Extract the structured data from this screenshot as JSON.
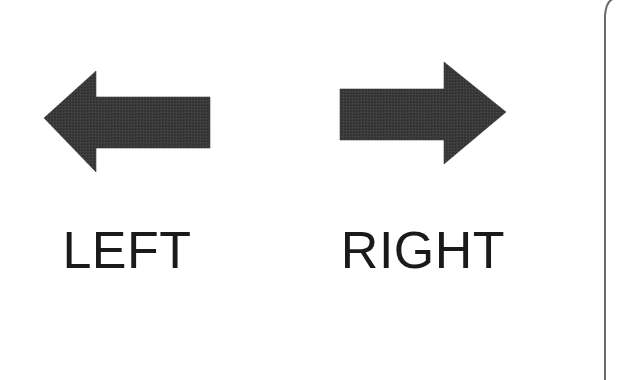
{
  "page": {
    "background_color": "#ffffff",
    "width": 632,
    "height": 380,
    "edge_line_color": "#6b6b6b"
  },
  "controls": [
    {
      "id": "left",
      "icon": "arrow-left-icon",
      "label": "LEFT",
      "direction": "left",
      "fill_color": "#3b3b3b",
      "label_color": "#1a1a1a"
    },
    {
      "id": "right",
      "icon": "arrow-right-icon",
      "label": "RIGHT",
      "direction": "right",
      "fill_color": "#3b3b3b",
      "label_color": "#1a1a1a"
    }
  ],
  "left": {
    "label": "LEFT"
  },
  "right": {
    "label": "RIGHT"
  }
}
